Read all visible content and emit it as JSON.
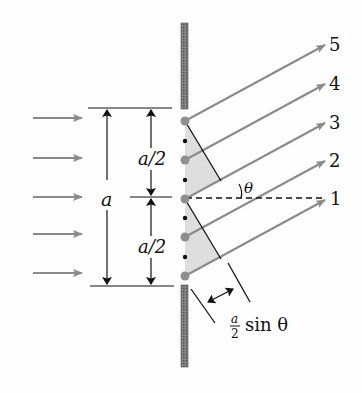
{
  "diagram": {
    "colors": {
      "ray": "#8a8a8a",
      "wall": "#6f6f6f",
      "source_dot": "#8f8f8f",
      "small_dot": "#111111",
      "shade": "#dcdcdc",
      "ink": "#111111"
    },
    "labels": {
      "ray_5": "5",
      "ray_4": "4",
      "ray_3": "3",
      "ray_2": "2",
      "ray_1": "1",
      "slit_width": "a",
      "upper_half": "a/2",
      "lower_half": "a/2",
      "angle": "θ",
      "path_diff_num": "a",
      "path_diff_den": "2",
      "path_diff_text": "sin θ"
    },
    "incident_arrows": 5,
    "outgoing_rays": [
      "5",
      "4",
      "3",
      "2",
      "1"
    ]
  }
}
